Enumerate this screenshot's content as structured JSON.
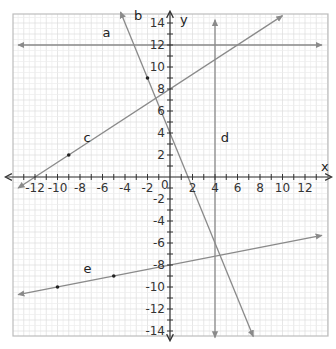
{
  "chart_data": {
    "type": "line",
    "title": "",
    "xlabel": "x",
    "ylabel": "y",
    "xlim": [
      -14,
      14
    ],
    "ylim": [
      -15,
      15
    ],
    "grid": true,
    "origin_label": "0",
    "x_ticks": [
      -12,
      -10,
      -8,
      -6,
      -4,
      -2,
      2,
      4,
      6,
      8,
      10,
      12
    ],
    "y_ticks": [
      14,
      12,
      10,
      8,
      6,
      4,
      2,
      -2,
      -4,
      -6,
      -8,
      -10,
      -12,
      -14
    ],
    "series": [
      {
        "name": "a",
        "equation": "y = 12",
        "type": "horizontal",
        "y": 12,
        "x_range": [
          -13.5,
          13.5
        ],
        "label_pos": [
          -6,
          12.7
        ]
      },
      {
        "name": "b",
        "equation": "y = -2.5x + 4",
        "slope": -2.5,
        "intercept": 4,
        "x_range": [
          -4.4,
          7.4
        ],
        "points": [
          [
            -2,
            9
          ]
        ],
        "label_pos": [
          -3.2,
          14.3
        ]
      },
      {
        "name": "c",
        "equation": "y = (2/3)x + 8",
        "slope": 0.6667,
        "intercept": 8,
        "x_range": [
          -13.5,
          10
        ],
        "points": [
          [
            -9,
            2
          ]
        ],
        "label_pos": [
          -7.7,
          3.2
        ]
      },
      {
        "name": "d",
        "equation": "x = 4",
        "type": "vertical",
        "x": 4,
        "y_range": [
          -14.6,
          14.3
        ],
        "label_pos": [
          4.5,
          3.2
        ]
      },
      {
        "name": "e",
        "equation": "y = 0.2x - 8",
        "slope": 0.2,
        "intercept": -8,
        "x_range": [
          -13.5,
          13.5
        ],
        "points": [
          [
            -10,
            -10
          ],
          [
            -5,
            -9
          ]
        ],
        "label_pos": [
          -7.7,
          -8.7
        ]
      }
    ]
  },
  "labels": {
    "x_axis": "x",
    "y_axis": "y",
    "origin": "0"
  }
}
